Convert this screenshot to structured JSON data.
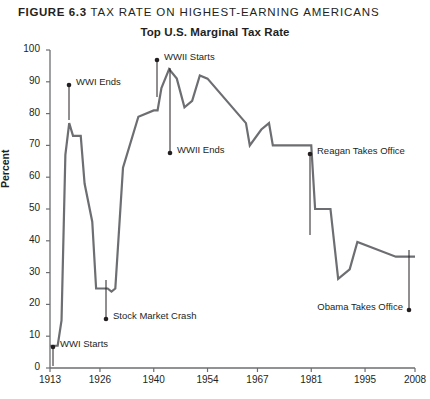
{
  "figure": {
    "number": "FIGURE 6.3",
    "caption": "TAX RATE ON HIGHEST-EARNING AMERICANS"
  },
  "chart_data": {
    "type": "line",
    "title": "Top U.S. Marginal Tax Rate",
    "xlabel": "",
    "ylabel": "Percent",
    "xlim": [
      1913,
      2008
    ],
    "ylim": [
      0,
      100
    ],
    "grid": false,
    "legend": "none",
    "line_color": "#6d6e71",
    "xticks": [
      1913,
      1926,
      1940,
      1954,
      1967,
      1981,
      1995,
      2008
    ],
    "yticks": [
      0,
      10,
      20,
      30,
      40,
      50,
      60,
      70,
      80,
      90,
      100
    ],
    "series": [
      {
        "name": "Top U.S. Marginal Tax Rate",
        "x": [
          1913,
          1915,
          1916,
          1917,
          1918,
          1919,
          1921,
          1922,
          1924,
          1925,
          1926,
          1928,
          1929,
          1930,
          1932,
          1936,
          1940,
          1941,
          1942,
          1944,
          1946,
          1948,
          1950,
          1952,
          1954,
          1964,
          1965,
          1968,
          1970,
          1971,
          1981,
          1982,
          1986,
          1988,
          1991,
          1993,
          2003,
          2008
        ],
        "y": [
          7,
          7,
          15,
          67,
          77,
          73,
          73,
          58,
          46,
          25,
          25,
          25,
          24,
          25,
          63,
          79,
          81,
          81,
          88,
          94,
          91,
          82,
          84,
          92,
          91,
          77,
          70,
          75,
          77,
          70,
          70,
          50,
          50,
          28,
          31,
          39.6,
          35,
          35
        ]
      }
    ],
    "annotations": [
      {
        "label": "WWI Starts",
        "x": 1913,
        "y": 2,
        "dot_px": [
          53,
          347
        ],
        "text_px": [
          60,
          344
        ],
        "align": "left",
        "leader_to": [
          53,
          366
        ]
      },
      {
        "label": "WWI Ends",
        "x": 1918,
        "y": 90,
        "dot_px": [
          69,
          85
        ],
        "text_px": [
          76,
          82
        ],
        "align": "left",
        "leader_to": [
          69,
          120
        ]
      },
      {
        "label": "Stock Market Crash",
        "x": 1929,
        "y": 13,
        "dot_px": [
          106,
          319
        ],
        "text_px": [
          113,
          316
        ],
        "align": "left",
        "leader_to": [
          106,
          280
        ]
      },
      {
        "label": "WWII Starts",
        "x": 1941,
        "y": 98,
        "dot_px": [
          157,
          60
        ],
        "text_px": [
          164,
          57
        ],
        "align": "left",
        "leader_to": [
          157,
          97
        ]
      },
      {
        "label": "WWII Ends",
        "x": 1945,
        "y": 69,
        "dot_px": [
          170,
          153
        ],
        "text_px": [
          177,
          150
        ],
        "align": "left",
        "leader_to": [
          170,
          68
        ]
      },
      {
        "label": "Reagan Takes Office",
        "x": 1981,
        "y": 69,
        "dot_px": [
          310,
          154
        ],
        "text_px": [
          317,
          151
        ],
        "align": "left",
        "leader_to": [
          310,
          235
        ]
      },
      {
        "label": "Obama Takes Office",
        "x": 2008,
        "y": 17,
        "dot_px": [
          409,
          310
        ],
        "text_px": [
          403,
          307
        ],
        "align": "right",
        "leader_to": [
          409,
          250
        ]
      }
    ]
  }
}
